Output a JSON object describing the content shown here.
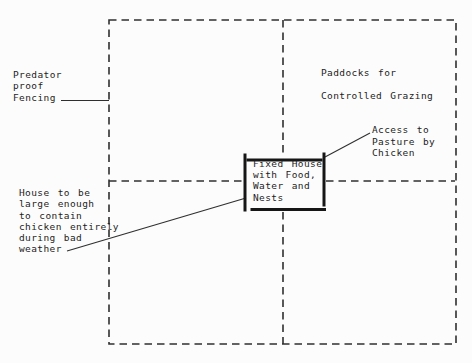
{
  "diagram": {
    "colors": {
      "bg": "#fcfcfc",
      "line": "#2f2f2f",
      "bar": "#161616",
      "ink": "#1d1d1d"
    },
    "labels": {
      "predator_fencing": {
        "lines": [
          "Predator",
          "proof",
          "Fencing"
        ]
      },
      "paddocks": {
        "lines": [
          "Paddocks for",
          "Controlled Grazing"
        ]
      },
      "access": {
        "lines": [
          "Access to",
          "Pasture by",
          "Chicken"
        ]
      },
      "house_note": {
        "lines": [
          "House to be",
          "large enough",
          "to contain",
          "chicken entirely",
          "during bad",
          "weather"
        ]
      },
      "fixed_house": {
        "lines": [
          "Fixed House",
          "with Food,",
          "Water and",
          "Nests"
        ]
      }
    }
  }
}
